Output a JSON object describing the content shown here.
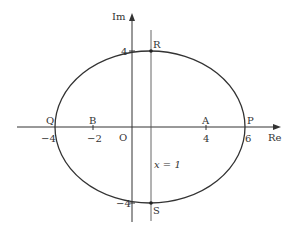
{
  "diagram": {
    "type": "argand-diagram-ellipse",
    "axes": {
      "x_label": "Re",
      "y_label": "Im",
      "origin_label": "O"
    },
    "ellipse": {
      "center": [
        1,
        0
      ],
      "semi_major_real": 5,
      "semi_minor_imag": 4
    },
    "vertical_line": {
      "x": 1,
      "label": "x = 1"
    },
    "points": [
      {
        "name": "P",
        "re": 6,
        "im": 0
      },
      {
        "name": "Q",
        "re": -4,
        "im": 0
      },
      {
        "name": "A",
        "re": 4,
        "im": 0
      },
      {
        "name": "B",
        "re": -2,
        "im": 0
      },
      {
        "name": "R",
        "re": 1,
        "im": 4
      },
      {
        "name": "S",
        "re": 1,
        "im": -4
      }
    ],
    "tick_labels": {
      "re": [
        "-4",
        "-2",
        "4",
        "6"
      ],
      "im": [
        "4",
        "-4"
      ]
    },
    "colors": {
      "line": "#333333",
      "background": "#ffffff"
    }
  }
}
